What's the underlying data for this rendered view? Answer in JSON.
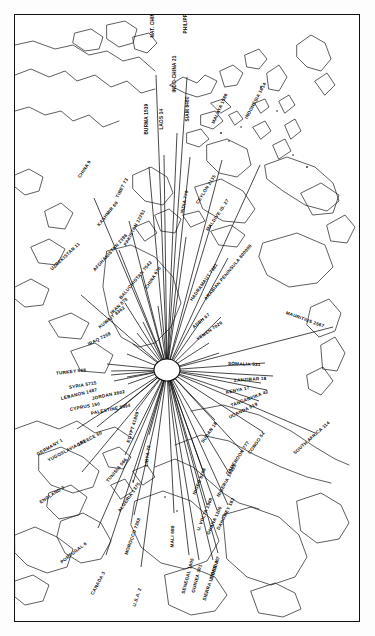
{
  "figure": {
    "type": "radial-flow-map",
    "hub_label": "MECCA"
  },
  "chart_data": {
    "type": "radial-flow-map",
    "title": "",
    "hub": {
      "name": "MECCA",
      "x": 152,
      "y": 355
    },
    "series": [
      {
        "name": "NAT. CHINA 28",
        "label": "NAT. CHINA 28",
        "country": "NAT. CHINA",
        "value": 28,
        "x": 137,
        "y": 20,
        "rot": -90,
        "ex": 141,
        "ey": 60
      },
      {
        "name": "PHILIPPINES 2367",
        "label": "PHILIPPINES 2367",
        "country": "PHILIPPINES",
        "value": 2367,
        "x": 170,
        "y": 16,
        "rot": -90,
        "ex": 172,
        "ey": 62
      },
      {
        "name": "INDO-CHINA 21",
        "label": "INDO-CHINA 21",
        "country": "INDO-CHINA",
        "value": 21,
        "x": 159,
        "y": 75,
        "rot": -90,
        "ex": 162,
        "ey": 118
      },
      {
        "name": "LAOS 14",
        "label": "LAOS 14",
        "country": "LAOS",
        "value": 14,
        "x": 146,
        "y": 112,
        "rot": -90,
        "ex": 149,
        "ey": 140
      },
      {
        "name": "BURMA 1539",
        "label": "BURMA 1539",
        "country": "BURMA",
        "value": 1539,
        "x": 131,
        "y": 117,
        "rot": -90,
        "ex": 134,
        "ey": 152
      },
      {
        "name": "SIAM 6480",
        "label": "SIAM 6480",
        "country": "SIAM",
        "value": 6480,
        "x": 172,
        "y": 104,
        "rot": -90,
        "ex": 175,
        "ey": 142
      },
      {
        "name": "MALAYA 1586",
        "label": "MALAYA 1586",
        "country": "MALAYA",
        "value": 1586,
        "x": 198,
        "y": 106,
        "rot": -66,
        "ex": 207,
        "ey": 145
      },
      {
        "name": "INDONESIA 1614",
        "label": "INDONESIA 1614",
        "country": "INDONESIA",
        "value": 1614,
        "x": 231,
        "y": 101,
        "rot": -62,
        "ex": 245,
        "ey": 150
      },
      {
        "name": "CEYLON 2135",
        "label": "CEYLON 2135",
        "country": "CEYLON",
        "value": 2135,
        "x": 182,
        "y": 186,
        "rot": -58,
        "ex": 196,
        "ey": 210
      },
      {
        "name": "MALDIVE IS. 27",
        "label": "MALDIVE IS. 27",
        "country": "MALDIVE IS.",
        "value": 27,
        "x": 192,
        "y": 213,
        "rot": -56,
        "ex": 213,
        "ey": 243
      },
      {
        "name": "INDIA 770",
        "label": "INDIA 770",
        "country": "INDIA",
        "value": 770,
        "x": 167,
        "y": 196,
        "rot": -78,
        "ex": 171,
        "ey": 222
      },
      {
        "name": "CHINA 9",
        "label": "CHINA 9",
        "country": "CHINA",
        "value": 9,
        "x": 64,
        "y": 160,
        "rot": -57,
        "ex": 79,
        "ey": 183
      },
      {
        "name": "TIBET 73",
        "label": "TIBET 73",
        "country": "TIBET",
        "value": 73,
        "x": 102,
        "y": 180,
        "rot": -63,
        "ex": 114,
        "ey": 206
      },
      {
        "name": "KASHMIR 69",
        "label": "KASHMIR 69",
        "country": "KASHMIR",
        "value": 69,
        "x": 83,
        "y": 208,
        "rot": -51,
        "ex": 104,
        "ey": 235
      },
      {
        "name": "UZBEKISTAN 11",
        "label": "UZBEKISTAN 11",
        "country": "UZBEKISTAN",
        "value": 11,
        "x": 36,
        "y": 252,
        "rot": -43,
        "ex": 66,
        "ey": 280
      },
      {
        "name": "PAKISTAN 12251",
        "label": "PAKISTAN 12251",
        "country": "PAKISTAN",
        "value": 12251,
        "x": 110,
        "y": 228,
        "rot": -62,
        "ex": 126,
        "ey": 260
      },
      {
        "name": "AFGHANISTAN 2396",
        "label": "AFGHANISTAN 2396",
        "country": "AFGHANISTAN",
        "value": 2396,
        "x": 79,
        "y": 253,
        "rot": -48,
        "ex": 110,
        "ey": 288
      },
      {
        "name": "CHINA 970",
        "label": "CHINA 970",
        "country": "CHINA",
        "value": 970,
        "x": 131,
        "y": 271,
        "rot": -57,
        "ex": 143,
        "ey": 291
      },
      {
        "name": "BALUCHISTAN 7542",
        "label": "BALUCHISTAN 7542",
        "country": "BALUCHISTAN",
        "value": 7542,
        "x": 105,
        "y": 281,
        "rot": -50,
        "ex": 128,
        "ey": 307
      },
      {
        "name": "IRAN 878",
        "label": "IRAN 878",
        "country": "IRAN",
        "value": 878,
        "x": 96,
        "y": 296,
        "rot": -44,
        "ex": 122,
        "ey": 318
      },
      {
        "name": "KUWAIT 8362",
        "label": "KUWAIT 8362",
        "country": "KUWAIT",
        "value": 8362,
        "x": 84,
        "y": 310,
        "rot": -39,
        "ex": 118,
        "ey": 329
      },
      {
        "name": "IRAQ 7268",
        "label": "IRAQ 7268",
        "country": "IRAQ",
        "value": 7268,
        "x": 73,
        "y": 327,
        "rot": -27,
        "ex": 112,
        "ey": 339
      },
      {
        "name": "TURKEY 568",
        "label": "TURKEY 568",
        "country": "TURKEY",
        "value": 568,
        "x": 41,
        "y": 356,
        "rot": -7,
        "ex": 92,
        "ey": 349
      },
      {
        "name": "SYRIA 5715",
        "label": "SYRIA 5715",
        "country": "SYRIA",
        "value": 5715,
        "x": 54,
        "y": 370,
        "rot": -10,
        "ex": 96,
        "ey": 356
      },
      {
        "name": "LEBANON 1487",
        "label": "LEBANON 1487",
        "country": "LEBANON",
        "value": 1487,
        "x": 46,
        "y": 381,
        "rot": -14,
        "ex": 96,
        "ey": 360
      },
      {
        "name": "JORDAN 2802",
        "label": "JORDAN 2802",
        "country": "JORDAN",
        "value": 2802,
        "x": 77,
        "y": 381,
        "rot": -12,
        "ex": 112,
        "ey": 362
      },
      {
        "name": "CYPRUS 150",
        "label": "CYPRUS 150",
        "country": "CYPRUS",
        "value": 150,
        "x": 55,
        "y": 392,
        "rot": -11,
        "ex": 99,
        "ey": 366
      },
      {
        "name": "PALESTINE 5594",
        "label": "PALESTINE 5594",
        "country": "PALESTINE",
        "value": 5594,
        "x": 76,
        "y": 396,
        "rot": -12,
        "ex": 113,
        "ey": 369
      },
      {
        "name": "GREECE 60",
        "label": "GREECE 60",
        "country": "GREECE",
        "value": 60,
        "x": 62,
        "y": 428,
        "rot": -28,
        "ex": 100,
        "ey": 398
      },
      {
        "name": "YUGOSLAVIA 153",
        "label": "YUGOSLAVIA 153",
        "country": "YUGOSLAVIA",
        "value": 153,
        "x": 33,
        "y": 443,
        "rot": -28,
        "ex": 82,
        "ey": 412
      },
      {
        "name": "GERMANY 1",
        "label": "GERMANY 1",
        "country": "GERMANY",
        "value": 1,
        "x": 22,
        "y": 437,
        "rot": -30,
        "ex": 62,
        "ey": 414
      },
      {
        "name": "ENGLAND 3",
        "label": "ENGLAND 3",
        "country": "ENGLAND",
        "value": 3,
        "x": 25,
        "y": 485,
        "rot": -33,
        "ex": 67,
        "ey": 457
      },
      {
        "name": "PORTUGAL 6",
        "label": "PORTUGAL 6",
        "country": "PORTUGAL",
        "value": 6,
        "x": 46,
        "y": 545,
        "rot": -38,
        "ex": 83,
        "ey": 513
      },
      {
        "name": "CANADA 3",
        "label": "CANADA 3",
        "country": "CANADA",
        "value": 3,
        "x": 77,
        "y": 577,
        "rot": -62,
        "ex": 91,
        "ey": 540
      },
      {
        "name": "U.S.A. 2",
        "label": "U.S.A. 2",
        "country": "U.S.A.",
        "value": 2,
        "x": 119,
        "y": 589,
        "rot": -72,
        "ex": 126,
        "ey": 552
      },
      {
        "name": "MOROCCO 7388",
        "label": "MOROCCO 7388",
        "country": "MOROCCO",
        "value": 7388,
        "x": 111,
        "y": 537,
        "rot": -70,
        "ex": 119,
        "ey": 500
      },
      {
        "name": "ALGERIA 1375",
        "label": "ALGERIA 1375",
        "country": "ALGERIA",
        "value": 1375,
        "x": 104,
        "y": 494,
        "rot": -55,
        "ex": 118,
        "ey": 468
      },
      {
        "name": "TUNISIA 566",
        "label": "TUNISIA 566",
        "country": "TUNISIA",
        "value": 566,
        "x": 92,
        "y": 464,
        "rot": -50,
        "ex": 110,
        "ey": 440
      },
      {
        "name": "LIBYA 76",
        "label": "LIBYA 76",
        "country": "LIBYA",
        "value": 76,
        "x": 131,
        "y": 449,
        "rot": -82,
        "ex": 134,
        "ey": 420
      },
      {
        "name": "EGYPT 41869",
        "label": "EGYPT 41869",
        "country": "EGYPT",
        "value": 41869,
        "x": 113,
        "y": 425,
        "rot": -73,
        "ex": 121,
        "ey": 396
      },
      {
        "name": "MALI 689",
        "label": "MALI 689",
        "country": "MALI",
        "value": 689,
        "x": 157,
        "y": 530,
        "rot": -88,
        "ex": 159,
        "ey": 498
      },
      {
        "name": "SENEGAL 1005",
        "label": "SENEGAL 1005",
        "country": "SENEGAL",
        "value": 1005,
        "x": 168,
        "y": 576,
        "rot": -75,
        "ex": 174,
        "ey": 540
      },
      {
        "name": "GUINEA 301",
        "label": "GUINEA 301",
        "country": "GUINEA",
        "value": 301,
        "x": 178,
        "y": 575,
        "rot": -75,
        "ex": 184,
        "ey": 545
      },
      {
        "name": "SIERRA LEONE 30",
        "label": "SIERRA LEONE 30",
        "country": "SIERRA LEONE",
        "value": 30,
        "x": 189,
        "y": 583,
        "rot": -72,
        "ex": 198,
        "ey": 545
      },
      {
        "name": "LIBERIA 7",
        "label": "LIBERIA 7",
        "country": "LIBERIA",
        "value": 7,
        "x": 196,
        "y": 562,
        "rot": -72,
        "ex": 203,
        "ey": 538
      },
      {
        "name": "U. VOLTA 2968",
        "label": "U. VOLTA 2968",
        "country": "U. VOLTA",
        "value": 2968,
        "x": 183,
        "y": 513,
        "rot": -68,
        "ex": 192,
        "ey": 490
      },
      {
        "name": "GHANA 1200",
        "label": "GHANA 1200",
        "country": "GHANA",
        "value": 1200,
        "x": 193,
        "y": 517,
        "rot": -66,
        "ex": 202,
        "ey": 495
      },
      {
        "name": "DAHOMEY 163",
        "label": "DAHOMEY 163",
        "country": "DAHOMEY",
        "value": 163,
        "x": 203,
        "y": 512,
        "rot": -64,
        "ex": 213,
        "ey": 490
      },
      {
        "name": "NIGERIA 14453",
        "label": "NIGERIA 14453",
        "country": "NIGERIA",
        "value": 14453,
        "x": 203,
        "y": 479,
        "rot": -62,
        "ex": 214,
        "ey": 458
      },
      {
        "name": "NIGER 8258",
        "label": "NIGER 8258",
        "country": "NIGER",
        "value": 8258,
        "x": 179,
        "y": 477,
        "rot": -68,
        "ex": 188,
        "ey": 456
      },
      {
        "name": "CAMEROON 777",
        "label": "CAMEROON 777",
        "country": "CAMEROON",
        "value": 777,
        "x": 212,
        "y": 457,
        "rot": -57,
        "ex": 227,
        "ey": 436
      },
      {
        "name": "CONGO 54",
        "label": "CONGO 54",
        "country": "CONGO",
        "value": 54,
        "x": 234,
        "y": 436,
        "rot": -55,
        "ex": 248,
        "ey": 417
      },
      {
        "name": "SUDAN 18",
        "label": "SUDAN 18",
        "country": "SUDAN",
        "value": 18,
        "x": 187,
        "y": 425,
        "rot": -55,
        "ex": 200,
        "ey": 405
      },
      {
        "name": "SOUTH AFRICA 114",
        "label": "SOUTH AFRICA 114",
        "country": "SOUTH AFRICA",
        "value": 114,
        "x": 279,
        "y": 436,
        "rot": -42,
        "ex": 300,
        "ey": 418
      },
      {
        "name": "UGANDA 519",
        "label": "UGANDA 519",
        "country": "UGANDA",
        "value": 519,
        "x": 214,
        "y": 400,
        "rot": -26,
        "ex": 244,
        "ey": 386
      },
      {
        "name": "TANGANYIKA 42",
        "label": "TANGANYIKA 42",
        "country": "TANGANYIKA",
        "value": 42,
        "x": 216,
        "y": 388,
        "rot": -21,
        "ex": 252,
        "ey": 375
      },
      {
        "name": "KENYA 17",
        "label": "KENYA 17",
        "country": "KENYA",
        "value": 17,
        "x": 211,
        "y": 375,
        "rot": -12,
        "ex": 246,
        "ey": 368
      },
      {
        "name": "ZANZIBAR 18",
        "label": "ZANZIBAR 18",
        "country": "ZANZIBAR",
        "value": 18,
        "x": 219,
        "y": 363,
        "rot": -4,
        "ex": 258,
        "ey": 361
      },
      {
        "name": "SOMALIA 531",
        "label": "SOMALIA 531",
        "country": "SOMALIA",
        "value": 531,
        "x": 213,
        "y": 346,
        "rot": 2,
        "ex": 250,
        "ey": 348
      },
      {
        "name": "MAURITIUS 2567",
        "label": "MAURITIUS 2567",
        "country": "MAURITIUS",
        "value": 2567,
        "x": 271,
        "y": 295,
        "rot": 20,
        "ex": 318,
        "ey": 312
      },
      {
        "name": "YEMEN 7029",
        "label": "YEMEN 7029",
        "country": "YEMEN",
        "value": 7029,
        "x": 182,
        "y": 322,
        "rot": -35,
        "ex": 204,
        "ey": 338
      },
      {
        "name": "ADEN 67",
        "label": "ADEN 67",
        "country": "ADEN",
        "value": 67,
        "x": 178,
        "y": 310,
        "rot": -40,
        "ex": 194,
        "ey": 328
      },
      {
        "name": "ARABIAN PENINSULA 800000",
        "label": "ARABIAN PENINSULA 800000",
        "country": "ARABIAN PENINSULA",
        "value": 800000,
        "x": 190,
        "y": 282,
        "rot": -50,
        "ex": 206,
        "ey": 302
      },
      {
        "name": "HADRAMAUT 7381",
        "label": "HADRAMAUT 7381",
        "country": "HADRAMAUT",
        "value": 7381,
        "x": 176,
        "y": 283,
        "rot": -55,
        "ex": 188,
        "ey": 303
      }
    ]
  }
}
